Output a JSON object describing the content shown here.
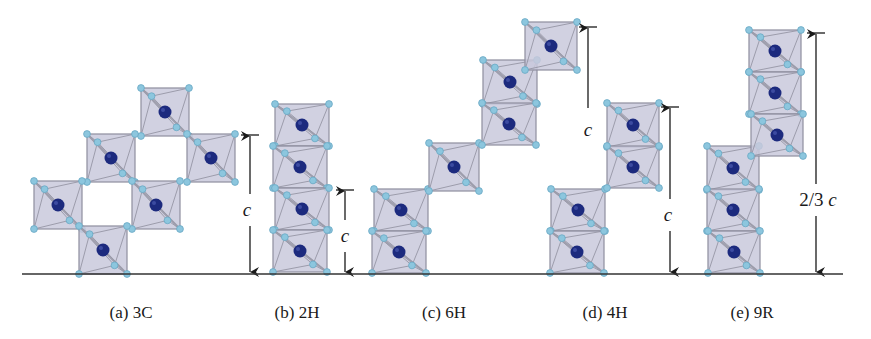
{
  "figure": {
    "baseline": {
      "y": 274,
      "x1": 22,
      "x2": 843
    },
    "colors": {
      "octahedron_fill": "#c9c9dc",
      "octahedron_edge": "#8e8e9e",
      "anion": "#8cc6de",
      "cation": "#1c2a7e",
      "line": "#1a1a1a"
    },
    "panels": [
      {
        "id": "3C",
        "caption": "(a) 3C",
        "caption_x": 131,
        "octahedra": [
          {
            "cx": 165,
            "cy": 112,
            "s": 48
          },
          {
            "cx": 111,
            "cy": 158,
            "s": 48
          },
          {
            "cx": 211,
            "cy": 158,
            "s": 48
          },
          {
            "cx": 58,
            "cy": 205,
            "s": 48
          },
          {
            "cx": 156,
            "cy": 205,
            "s": 48
          },
          {
            "cx": 103,
            "cy": 250,
            "s": 48
          }
        ],
        "dimension": {
          "label": "c",
          "x": 250,
          "top": 135,
          "bottom": 272,
          "label_y": 210
        }
      },
      {
        "id": "2H",
        "caption": "(b) 2H",
        "caption_x": 297,
        "octahedra": [
          {
            "cx": 302,
            "cy": 125,
            "w": 54,
            "h": 42
          },
          {
            "cx": 300,
            "cy": 167,
            "w": 54,
            "h": 42
          },
          {
            "cx": 302,
            "cy": 209,
            "w": 54,
            "h": 42
          },
          {
            "cx": 300,
            "cy": 251,
            "w": 54,
            "h": 42
          }
        ],
        "dimension": {
          "label": "c",
          "x": 345,
          "top": 190,
          "bottom": 272,
          "label_y": 236
        }
      },
      {
        "id": "6H",
        "caption": "(c) 6H",
        "caption_x": 444,
        "octahedra": [
          {
            "cx": 401,
            "cy": 210,
            "w": 54,
            "h": 42
          },
          {
            "cx": 399,
            "cy": 252,
            "w": 54,
            "h": 42
          },
          {
            "cx": 454,
            "cy": 167,
            "w": 50,
            "h": 48
          },
          {
            "cx": 510,
            "cy": 82,
            "w": 54,
            "h": 44
          },
          {
            "cx": 509,
            "cy": 124,
            "w": 54,
            "h": 42
          },
          {
            "cx": 551,
            "cy": 46,
            "w": 52,
            "h": 48
          }
        ],
        "dimension": {
          "label": "c",
          "x": 588,
          "top": 27,
          "bottom": 108,
          "label_y": 130,
          "open_bottom": true
        }
      },
      {
        "id": "4H",
        "caption": "(d) 4H",
        "caption_x": 605,
        "octahedra": [
          {
            "cx": 578,
            "cy": 210,
            "w": 54,
            "h": 42
          },
          {
            "cx": 577,
            "cy": 252,
            "w": 54,
            "h": 42
          },
          {
            "cx": 633,
            "cy": 125,
            "w": 52,
            "h": 44
          },
          {
            "cx": 633,
            "cy": 167,
            "w": 52,
            "h": 42
          }
        ],
        "dimension": {
          "label": "c",
          "x": 670,
          "top": 107,
          "bottom": 272,
          "label_y": 215
        }
      },
      {
        "id": "9R",
        "caption": "(e) 9R",
        "caption_x": 752,
        "octahedra": [
          {
            "cx": 733,
            "cy": 168,
            "w": 52,
            "h": 44
          },
          {
            "cx": 733,
            "cy": 210,
            "w": 52,
            "h": 42
          },
          {
            "cx": 734,
            "cy": 252,
            "w": 52,
            "h": 42
          },
          {
            "cx": 775,
            "cy": 51,
            "w": 52,
            "h": 42
          },
          {
            "cx": 775,
            "cy": 93,
            "w": 52,
            "h": 42
          },
          {
            "cx": 777,
            "cy": 135,
            "w": 52,
            "h": 42
          }
        ],
        "dimension": {
          "label": "2/3 c",
          "label_prefix": "2/3 ",
          "label_var": "c",
          "x": 816,
          "top": 33,
          "bottom": 272,
          "label_y": 200
        }
      }
    ]
  },
  "captions": {
    "a": "(a) 3C",
    "b": "(b) 2H",
    "c": "(c) 6H",
    "d": "(d) 4H",
    "e": "(e) 9R"
  },
  "dimension_labels": {
    "a": "c",
    "b": "c",
    "c": "c",
    "d": "c",
    "e_prefix": "2/3 ",
    "e_var": "c"
  }
}
